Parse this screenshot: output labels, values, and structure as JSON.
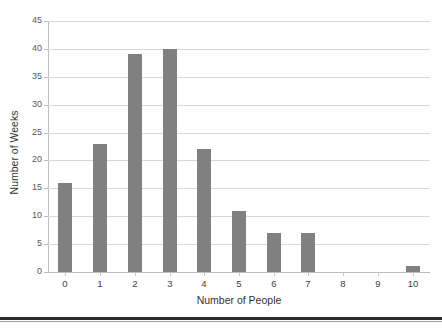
{
  "page": {
    "top_remnant_text": "",
    "background_color": "#ffffff",
    "bottom_rule_color": "#2b2b2b"
  },
  "chart_data": {
    "type": "bar",
    "title": "",
    "subtitle": "",
    "xlabel": "Number of People",
    "ylabel": "Number of Weeks",
    "categories": [
      "0",
      "1",
      "2",
      "3",
      "4",
      "5",
      "6",
      "7",
      "8",
      "9",
      "10"
    ],
    "values": [
      16,
      23,
      39,
      40,
      22,
      11,
      7,
      7,
      0,
      0,
      1
    ],
    "ylim": [
      0,
      45
    ],
    "ytick_step": 5,
    "yticks": [
      "0",
      "5",
      "10",
      "15",
      "20",
      "25",
      "30",
      "35",
      "40",
      "45"
    ],
    "grid": true,
    "grid_axis": "y",
    "legend": false,
    "legend_position": "none",
    "bar_color": "#808080",
    "gridline_color": "#d9d9d9",
    "axis_color": "#bdbdbd",
    "tick_label_color": "#585858",
    "axis_title_color": "#333333"
  }
}
